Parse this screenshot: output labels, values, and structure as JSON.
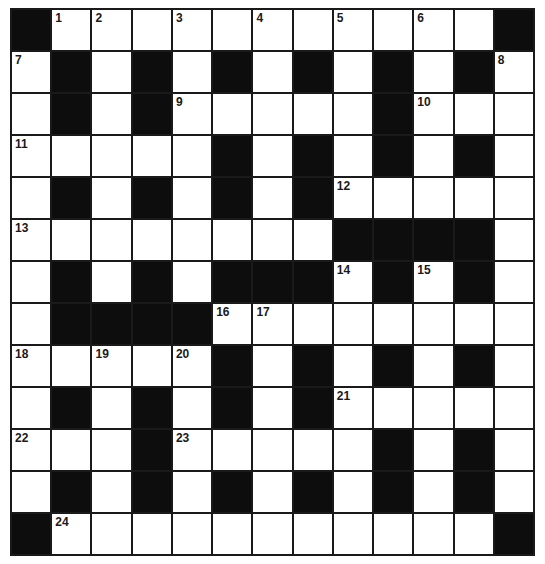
{
  "puzzle": {
    "rows": 13,
    "cols": 13,
    "colors": {
      "block": "#0d0d0d",
      "open": "#ffffff",
      "line": "#1a1a1a",
      "number": "#1a1a1a"
    },
    "legend": {
      "B": "black square",
      "W": "white square (unnumbered)",
      "number": "white square with clue number"
    },
    "grid": [
      [
        "B",
        "1",
        "2",
        "W",
        "3",
        "W",
        "4",
        "W",
        "5",
        "W",
        "6",
        "W",
        "B"
      ],
      [
        "7",
        "B",
        "W",
        "B",
        "W",
        "B",
        "W",
        "B",
        "W",
        "B",
        "W",
        "B",
        "8"
      ],
      [
        "W",
        "B",
        "W",
        "B",
        "9",
        "W",
        "W",
        "W",
        "W",
        "B",
        "10",
        "W",
        "W"
      ],
      [
        "11",
        "W",
        "W",
        "W",
        "W",
        "B",
        "W",
        "B",
        "W",
        "B",
        "W",
        "B",
        "W"
      ],
      [
        "W",
        "B",
        "W",
        "B",
        "W",
        "B",
        "W",
        "B",
        "12",
        "W",
        "W",
        "W",
        "W"
      ],
      [
        "13",
        "W",
        "W",
        "W",
        "W",
        "W",
        "W",
        "W",
        "B",
        "B",
        "B",
        "B",
        "W"
      ],
      [
        "W",
        "B",
        "W",
        "B",
        "W",
        "B",
        "B",
        "B",
        "14",
        "B",
        "15",
        "B",
        "W"
      ],
      [
        "W",
        "B",
        "B",
        "B",
        "B",
        "16",
        "17",
        "W",
        "W",
        "W",
        "W",
        "W",
        "W"
      ],
      [
        "18",
        "W",
        "19",
        "W",
        "20",
        "B",
        "W",
        "B",
        "W",
        "B",
        "W",
        "B",
        "W"
      ],
      [
        "W",
        "B",
        "W",
        "B",
        "W",
        "B",
        "W",
        "B",
        "21",
        "W",
        "W",
        "W",
        "W"
      ],
      [
        "22",
        "W",
        "W",
        "B",
        "23",
        "W",
        "W",
        "W",
        "W",
        "B",
        "W",
        "B",
        "W"
      ],
      [
        "W",
        "B",
        "W",
        "B",
        "W",
        "B",
        "W",
        "B",
        "W",
        "B",
        "W",
        "B",
        "W"
      ],
      [
        "B",
        "24",
        "W",
        "W",
        "W",
        "W",
        "W",
        "W",
        "W",
        "W",
        "W",
        "W",
        "B"
      ]
    ],
    "clue_numbers": [
      "1",
      "2",
      "3",
      "4",
      "5",
      "6",
      "7",
      "8",
      "9",
      "10",
      "11",
      "12",
      "13",
      "14",
      "15",
      "16",
      "17",
      "18",
      "19",
      "20",
      "21",
      "22",
      "23",
      "24"
    ]
  }
}
